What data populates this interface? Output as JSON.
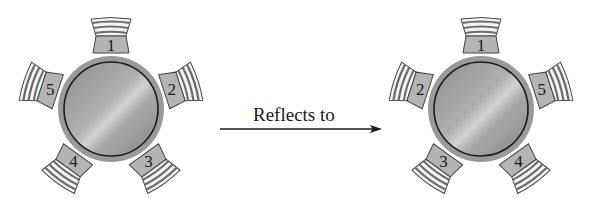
{
  "diagram": {
    "type": "reflection of round-table seating",
    "arrow_label": "Reflects to",
    "colors": {
      "table_outer": "#9a9a9a",
      "table_inner_light": "#c8c8c8",
      "table_inner_dark": "#8a8a8a",
      "table_ring": "#1a1a1a",
      "seat_fill": "#b4b4b4",
      "back_stripe_dark": "#6a6a6a",
      "back_stripe_light": "#f2f2f2",
      "arrow": "#1a1a1a"
    },
    "tables": [
      {
        "id": "original",
        "center": [
          111,
          109
        ],
        "seats": [
          {
            "label": "1",
            "angle_deg": 0
          },
          {
            "label": "2",
            "angle_deg": 72
          },
          {
            "label": "3",
            "angle_deg": 144
          },
          {
            "label": "4",
            "angle_deg": 216
          },
          {
            "label": "5",
            "angle_deg": 288
          }
        ]
      },
      {
        "id": "reflected",
        "center": [
          481,
          109
        ],
        "seats": [
          {
            "label": "1",
            "angle_deg": 0
          },
          {
            "label": "5",
            "angle_deg": 72
          },
          {
            "label": "4",
            "angle_deg": 144
          },
          {
            "label": "3",
            "angle_deg": 216
          },
          {
            "label": "2",
            "angle_deg": 288
          }
        ]
      }
    ]
  }
}
